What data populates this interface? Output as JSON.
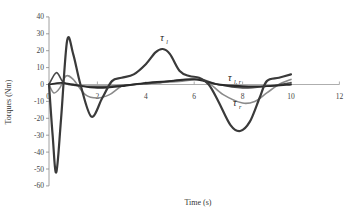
{
  "chart_data": {
    "type": "line",
    "title": "",
    "xlabel": "Time (s)",
    "ylabel": "Torques (Nm)",
    "xlim": [
      0,
      12
    ],
    "ylim": [
      -60,
      40
    ],
    "x_ticks": [
      0,
      2,
      4,
      6,
      8,
      10,
      12
    ],
    "y_ticks": [
      40,
      30,
      20,
      10,
      0,
      -10,
      -20,
      -30,
      -40,
      -50,
      -60
    ],
    "grid": false,
    "legend": "inline annotations",
    "annotations": [
      {
        "text": "τ",
        "sub": "l",
        "x": 4.6,
        "y": 26
      },
      {
        "text": "τ",
        "sub": "l, r",
        "x": 7.4,
        "y": 2
      },
      {
        "text": "τ",
        "sub": "r",
        "x": 7.6,
        "y": -13
      }
    ],
    "series": [
      {
        "name": "τ_l",
        "color": "#3a3a3a",
        "width": 2.2,
        "points": [
          [
            0,
            0
          ],
          [
            0.15,
            -30
          ],
          [
            0.3,
            -52
          ],
          [
            0.5,
            -20
          ],
          [
            0.75,
            26
          ],
          [
            1.0,
            18
          ],
          [
            1.3,
            0
          ],
          [
            1.75,
            -19
          ],
          [
            2.2,
            -8
          ],
          [
            2.6,
            2
          ],
          [
            3.0,
            4
          ],
          [
            3.5,
            6
          ],
          [
            4.0,
            12
          ],
          [
            4.4,
            19
          ],
          [
            4.7,
            21
          ],
          [
            5.0,
            18
          ],
          [
            5.4,
            8
          ],
          [
            5.8,
            5
          ],
          [
            6.2,
            4
          ],
          [
            6.6,
            0
          ],
          [
            7.0,
            -10
          ],
          [
            7.5,
            -24
          ],
          [
            7.9,
            -27.5
          ],
          [
            8.3,
            -22
          ],
          [
            8.7,
            -8
          ],
          [
            9.0,
            2
          ],
          [
            9.5,
            4
          ],
          [
            10,
            6
          ]
        ]
      },
      {
        "name": "τ_aux",
        "color": "#4a4a4a",
        "width": 1.6,
        "points": [
          [
            0,
            0
          ],
          [
            0.3,
            7
          ],
          [
            0.55,
            2
          ],
          [
            0.8,
            0
          ],
          [
            1.5,
            -1
          ],
          [
            2.5,
            -1
          ],
          [
            3.5,
            0
          ],
          [
            4.5,
            1
          ],
          [
            5.5,
            3
          ],
          [
            6.3,
            3
          ],
          [
            7,
            0
          ],
          [
            8,
            -2
          ],
          [
            9,
            -1
          ],
          [
            10,
            1
          ]
        ]
      },
      {
        "name": "τ_r",
        "color": "#8a8a8a",
        "width": 1.6,
        "points": [
          [
            0,
            0
          ],
          [
            0.2,
            -5
          ],
          [
            0.45,
            -2
          ],
          [
            0.7,
            5
          ],
          [
            1.0,
            3
          ],
          [
            1.5,
            -6
          ],
          [
            2.0,
            -8
          ],
          [
            2.5,
            -6
          ],
          [
            3.0,
            -1
          ],
          [
            3.5,
            0
          ],
          [
            4.5,
            1
          ],
          [
            5.5,
            2
          ],
          [
            6.2,
            3
          ],
          [
            6.6,
            1
          ],
          [
            7.2,
            -6
          ],
          [
            8.0,
            -11
          ],
          [
            8.5,
            -10
          ],
          [
            9.0,
            -5
          ],
          [
            9.5,
            0
          ],
          [
            10,
            3
          ]
        ]
      },
      {
        "name": "τ_l,r",
        "color": "#2a2a2a",
        "width": 1.8,
        "points": [
          [
            0,
            0
          ],
          [
            0.5,
            1
          ],
          [
            1.0,
            0
          ],
          [
            2,
            -2
          ],
          [
            3,
            -1
          ],
          [
            4,
            1
          ],
          [
            5,
            2
          ],
          [
            6,
            3
          ],
          [
            7,
            0
          ],
          [
            8,
            -1
          ],
          [
            9,
            -1
          ],
          [
            10,
            0
          ]
        ]
      }
    ]
  },
  "labels": {
    "xlabel": "Time (s)",
    "ylabel": "Torques (Nm)"
  }
}
